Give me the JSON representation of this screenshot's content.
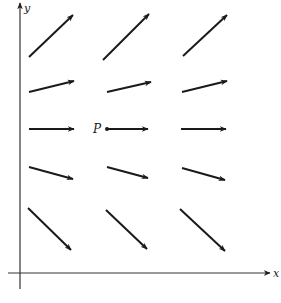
{
  "figure": {
    "type": "direction field / vector field",
    "axes": {
      "x_label": "x",
      "y_label": "y",
      "x_axis": {
        "x1": 8,
        "y": 273,
        "x2": 270
      },
      "y_axis": {
        "x": 20,
        "y1": 289,
        "y2": 3
      }
    },
    "point": {
      "label": "P",
      "x": 107,
      "y": 129
    },
    "stroke_color": "#1a1a1a",
    "arrows": [
      {
        "row": 1,
        "col": 1,
        "x1": 29,
        "y1": 57,
        "x2": 73,
        "y2": 15
      },
      {
        "row": 1,
        "col": 2,
        "x1": 103,
        "y1": 60,
        "x2": 149,
        "y2": 14
      },
      {
        "row": 1,
        "col": 3,
        "x1": 183,
        "y1": 56,
        "x2": 227,
        "y2": 15
      },
      {
        "row": 2,
        "col": 1,
        "x1": 29,
        "y1": 92,
        "x2": 74,
        "y2": 81
      },
      {
        "row": 2,
        "col": 2,
        "x1": 107,
        "y1": 92,
        "x2": 151,
        "y2": 82
      },
      {
        "row": 2,
        "col": 3,
        "x1": 182,
        "y1": 92,
        "x2": 227,
        "y2": 81
      },
      {
        "row": 3,
        "col": 1,
        "x1": 29,
        "y1": 129,
        "x2": 74,
        "y2": 129
      },
      {
        "row": 3,
        "col": 2,
        "x1": 107,
        "y1": 129,
        "x2": 148,
        "y2": 129
      },
      {
        "row": 3,
        "col": 3,
        "x1": 181,
        "y1": 129,
        "x2": 226,
        "y2": 129
      },
      {
        "row": 4,
        "col": 1,
        "x1": 29,
        "y1": 167,
        "x2": 73,
        "y2": 179
      },
      {
        "row": 4,
        "col": 2,
        "x1": 107,
        "y1": 167,
        "x2": 148,
        "y2": 178
      },
      {
        "row": 4,
        "col": 3,
        "x1": 182,
        "y1": 168,
        "x2": 225,
        "y2": 180
      },
      {
        "row": 5,
        "col": 1,
        "x1": 28,
        "y1": 208,
        "x2": 71,
        "y2": 250
      },
      {
        "row": 5,
        "col": 2,
        "x1": 106,
        "y1": 210,
        "x2": 147,
        "y2": 249
      },
      {
        "row": 5,
        "col": 3,
        "x1": 180,
        "y1": 209,
        "x2": 225,
        "y2": 251
      }
    ]
  }
}
